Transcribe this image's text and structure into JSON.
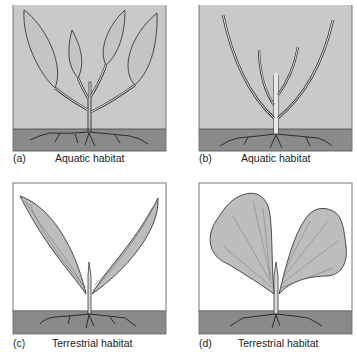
{
  "figure": {
    "panels": [
      {
        "id": "a",
        "letter": "(a)",
        "caption": "Aquatic habitat",
        "habitat": "aquatic",
        "leaf_form": "broad lanceolate submerged leaves"
      },
      {
        "id": "b",
        "letter": "(b)",
        "caption": "Aquatic habitat",
        "habitat": "aquatic",
        "leaf_form": "thin linear submerged leaves"
      },
      {
        "id": "c",
        "letter": "(c)",
        "caption": "Terrestrial habitat",
        "habitat": "terrestrial",
        "leaf_form": "long lanceolate leaves"
      },
      {
        "id": "d",
        "letter": "(d)",
        "caption": "Terrestrial habitat",
        "habitat": "terrestrial",
        "leaf_form": "broad fan-shaped leaves"
      }
    ],
    "colors": {
      "water": "#c9c9c9",
      "air": "#ffffff",
      "soil": "#8a8a8a",
      "leaf": "#bdbdbd",
      "outline": "#3a3a3a",
      "frame": "#777777"
    }
  }
}
